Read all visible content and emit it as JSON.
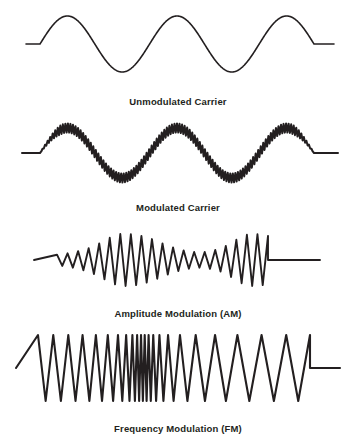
{
  "figure": {
    "background_color": "#ffffff",
    "stroke_color": "#231f20",
    "width": 356,
    "height": 438
  },
  "panels": [
    {
      "id": "unmodulated",
      "caption": "Unmodulated Carrier",
      "waveform": {
        "kind": "smooth-sine",
        "description": "Smooth low-frequency sine carrier with flat leads at both ends",
        "baseline_y": 44,
        "peak_y": 14,
        "trough_y": 71,
        "amplitude": 28,
        "cycles": 2.5,
        "wave_start_x": 40,
        "wave_end_x": 314,
        "lead_in_start_x": 26,
        "lead_out_end_x": 334,
        "stroke_width": 1.6
      }
    },
    {
      "id": "modulated",
      "caption": "Modulated Carrier",
      "waveform": {
        "kind": "sine-envelope-with-carrier-ripple",
        "description": "Same sine envelope carrying a constant-amplitude high-frequency zigzag",
        "baseline_y": 43,
        "peak_y": 14,
        "trough_y": 71,
        "amplitude": 25,
        "cycles": 2.5,
        "ripple_amplitude": 4.5,
        "ripple_count": 108,
        "wave_start_x": 40,
        "wave_end_x": 314,
        "lead_in_start_x": 22,
        "lead_out_end_x": 338,
        "stroke_width": 2.0
      }
    },
    {
      "id": "am",
      "caption": "Amplitude Modulation (AM)",
      "waveform": {
        "kind": "triangular-amplitude-modulated",
        "description": "Constant-frequency triangle carrier whose amplitude swells, dips, then swells again",
        "baseline_y": 45,
        "max_amplitude": 26,
        "min_amplitude": 3,
        "carrier_half_cycles": 40,
        "envelope_profile": [
          0.1,
          0.14,
          0.2,
          0.28,
          0.38,
          0.52,
          0.7,
          0.88,
          1.0,
          1.0,
          0.97,
          0.9,
          0.8,
          0.66,
          0.52,
          0.4,
          0.3,
          0.24,
          0.2,
          0.22,
          0.28,
          0.38,
          0.55,
          0.76,
          0.95,
          1.0,
          0.98,
          0.92
        ],
        "wave_start_x": 57,
        "wave_end_x": 268,
        "lead_in_start_x": 34,
        "lead_out_end_x": 320,
        "stroke_width": 1.9
      }
    },
    {
      "id": "fm",
      "caption": "Frequency Modulation (FM)",
      "waveform": {
        "kind": "triangular-frequency-modulated",
        "description": "Constant-amplitude triangle wave whose frequency rises sharply in the middle then relaxes",
        "baseline_y": 48,
        "amplitude": 33,
        "peak_y": 15,
        "trough_y": 81,
        "frequency_profile": [
          1.0,
          1.0,
          1.05,
          1.1,
          1.2,
          1.35,
          1.6,
          2.0,
          2.6,
          3.4,
          4.0,
          4.2,
          4.0,
          3.4,
          2.6,
          1.9,
          1.4,
          1.05,
          0.85,
          0.72,
          0.65,
          0.62,
          0.62,
          0.65
        ],
        "half_cycle_count": 44,
        "wave_start_x": 38,
        "wave_end_x": 310,
        "lead_in_start_x": 16,
        "lead_out_end_x": 340,
        "stroke_width": 2.1
      }
    }
  ]
}
